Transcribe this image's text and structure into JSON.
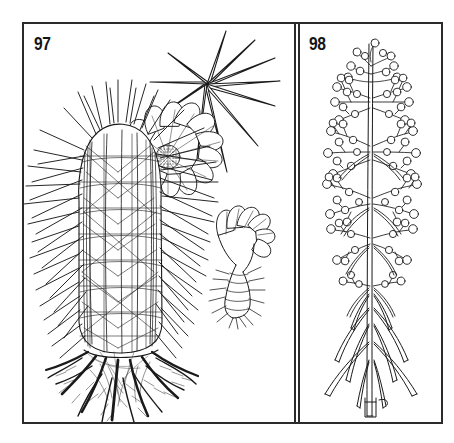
{
  "plate": {
    "background_color": "#ffffff",
    "ink_color": "#1a1a1a",
    "frame_color": "#2b2b2b",
    "style": "black-and-white pen-and-ink botanical line engraving",
    "panel_count": 2
  },
  "panels": [
    {
      "id": "panel-97",
      "figure_number": "97",
      "subject": "spiny barrel cactus with flowers and root system",
      "position": "left",
      "elements": [
        {
          "name": "cactus-body",
          "description": "upright ribbed cylindrical cactus stem densely covered in radiating spines"
        },
        {
          "name": "root-system",
          "description": "thick branching taproots with fine fibrous rootlets spreading below the stem base"
        },
        {
          "name": "open-flower",
          "description": "radially symmetric many-petalled flower in face view with stippled disc center"
        },
        {
          "name": "tubular-flower",
          "description": "side view of a funnel-shaped flower on a scaly bristly ovary tube"
        },
        {
          "name": "spine-cluster",
          "description": "enlarged detail of a single areole with ten radiating needle spines"
        }
      ]
    },
    {
      "id": "panel-98",
      "figure_number": "98",
      "subject": "slender herb with branched panicle of round berries and linear whorled leaves",
      "position": "right",
      "elements": [
        {
          "name": "main-stem",
          "description": "erect slender central stem drawn with twin parallel strokes"
        },
        {
          "name": "berry-panicle",
          "description": "open branched inflorescence bearing many small globose berries"
        },
        {
          "name": "linear-leaves",
          "description": "narrow needle-like leaves arranged in whorls along the lower stem"
        },
        {
          "name": "stem-base",
          "description": "cut basal end of the stem"
        }
      ]
    }
  ]
}
